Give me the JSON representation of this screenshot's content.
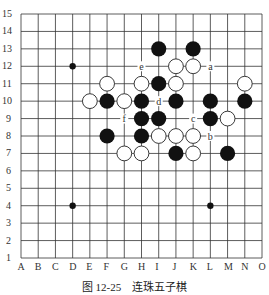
{
  "caption": {
    "figure": "图 12-25",
    "title": "连珠五子棋"
  },
  "board": {
    "columns": [
      "A",
      "B",
      "C",
      "D",
      "E",
      "F",
      "G",
      "H",
      "I",
      "J",
      "K",
      "L",
      "M",
      "N",
      "O"
    ],
    "rows": [
      1,
      2,
      3,
      4,
      5,
      6,
      7,
      8,
      9,
      10,
      11,
      12,
      13,
      14,
      15
    ],
    "star_points": [
      "D12",
      "D4",
      "L4"
    ],
    "black": [
      "I13",
      "K13",
      "I11",
      "F10",
      "H10",
      "J10",
      "L10",
      "N10",
      "H9",
      "I9",
      "L9",
      "F8",
      "H8",
      "J7",
      "M7"
    ],
    "white": [
      "J12",
      "K12",
      "F11",
      "H11",
      "J11",
      "N11",
      "E10",
      "G10",
      "M9",
      "I8",
      "J8",
      "K8",
      "G7",
      "H7",
      "K7"
    ],
    "markers": [
      {
        "label": "e",
        "pos": "H12"
      },
      {
        "label": "a",
        "pos": "L12"
      },
      {
        "label": "d",
        "pos": "I10"
      },
      {
        "label": "f",
        "pos": "G9"
      },
      {
        "label": "c",
        "pos": "K9"
      },
      {
        "label": "b",
        "pos": "L8"
      }
    ]
  },
  "colors": {
    "black": "#111111",
    "white": "#ffffff",
    "grid": "#333333"
  }
}
